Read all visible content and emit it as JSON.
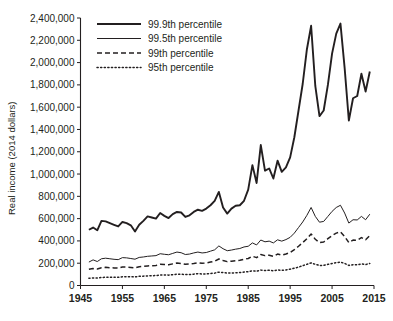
{
  "chart_data": {
    "type": "line",
    "title": "",
    "xlabel": "",
    "ylabel": "Real income (2014 dollars)",
    "xlim": [
      1945,
      2015
    ],
    "ylim": [
      0,
      2400000
    ],
    "xticks": [
      1945,
      1955,
      1965,
      1975,
      1985,
      1995,
      2005,
      2015
    ],
    "yticks": [
      0,
      200000,
      400000,
      600000,
      800000,
      1000000,
      1200000,
      1400000,
      1600000,
      1800000,
      2000000,
      2200000,
      2400000
    ],
    "ytick_labels": [
      "0",
      "200,000",
      "400,000",
      "600,000",
      "800,000",
      "1,000,000",
      "1,200,000",
      "1,400,000",
      "1,600,000",
      "1,800,000",
      "2,000,000",
      "2,200,000",
      "2,400,000"
    ],
    "xtick_labels": [
      "1945",
      "1955",
      "1965",
      "1975",
      "1985",
      "1995",
      "2005",
      "2015"
    ],
    "grid": false,
    "legend_position": "top-center",
    "x": [
      1947,
      1948,
      1949,
      1950,
      1951,
      1952,
      1953,
      1954,
      1955,
      1956,
      1957,
      1958,
      1959,
      1960,
      1961,
      1962,
      1963,
      1964,
      1965,
      1966,
      1967,
      1968,
      1969,
      1970,
      1971,
      1972,
      1973,
      1974,
      1975,
      1976,
      1977,
      1978,
      1979,
      1980,
      1981,
      1982,
      1983,
      1984,
      1985,
      1986,
      1987,
      1988,
      1989,
      1990,
      1991,
      1992,
      1993,
      1994,
      1995,
      1996,
      1997,
      1998,
      1999,
      2000,
      2001,
      2002,
      2003,
      2004,
      2005,
      2006,
      2007,
      2008,
      2009,
      2010,
      2011,
      2012,
      2013,
      2014
    ],
    "series": [
      {
        "name": "99.9th percentile",
        "style": "solid-thick",
        "values": [
          500000,
          520000,
          495000,
          580000,
          575000,
          560000,
          545000,
          530000,
          570000,
          560000,
          540000,
          485000,
          545000,
          580000,
          620000,
          610000,
          600000,
          650000,
          625000,
          605000,
          640000,
          660000,
          655000,
          615000,
          630000,
          660000,
          680000,
          670000,
          690000,
          720000,
          760000,
          840000,
          700000,
          645000,
          690000,
          715000,
          720000,
          760000,
          860000,
          1080000,
          920000,
          1260000,
          1030000,
          1050000,
          960000,
          1120000,
          1020000,
          1060000,
          1150000,
          1330000,
          1570000,
          1810000,
          2120000,
          2330000,
          1790000,
          1520000,
          1570000,
          1800000,
          2080000,
          2260000,
          2350000,
          1950000,
          1480000,
          1680000,
          1700000,
          1900000,
          1740000,
          1920000
        ]
      },
      {
        "name": "99.5th percentile",
        "style": "solid-thin",
        "values": [
          210000,
          230000,
          215000,
          240000,
          245000,
          240000,
          235000,
          232000,
          250000,
          248000,
          242000,
          236000,
          252000,
          256000,
          262000,
          265000,
          268000,
          285000,
          280000,
          276000,
          288000,
          300000,
          294000,
          278000,
          282000,
          292000,
          300000,
          292000,
          296000,
          308000,
          320000,
          355000,
          330000,
          312000,
          318000,
          326000,
          332000,
          346000,
          352000,
          382000,
          364000,
          408000,
          392000,
          398000,
          382000,
          410000,
          398000,
          412000,
          432000,
          470000,
          520000,
          570000,
          630000,
          700000,
          620000,
          568000,
          575000,
          620000,
          665000,
          700000,
          720000,
          650000,
          560000,
          590000,
          588000,
          620000,
          590000,
          640000
        ]
      },
      {
        "name": "99th percentile",
        "style": "dashed",
        "values": [
          145000,
          152000,
          148000,
          160000,
          163000,
          160000,
          158000,
          156000,
          166000,
          165000,
          162000,
          158000,
          168000,
          172000,
          176000,
          178000,
          180000,
          190000,
          188000,
          186000,
          194000,
          202000,
          198000,
          190000,
          193000,
          198000,
          204000,
          199000,
          202000,
          210000,
          218000,
          238000,
          225000,
          214000,
          218000,
          222000,
          226000,
          236000,
          242000,
          262000,
          250000,
          278000,
          268000,
          272000,
          262000,
          282000,
          272000,
          282000,
          296000,
          322000,
          352000,
          385000,
          420000,
          462000,
          415000,
          385000,
          390000,
          420000,
          448000,
          470000,
          482000,
          440000,
          385000,
          408000,
          406000,
          430000,
          410000,
          448000
        ]
      },
      {
        "name": "95th percentile",
        "style": "dotted",
        "values": [
          65000,
          68000,
          67000,
          72000,
          74000,
          74000,
          73000,
          73000,
          78000,
          79000,
          78000,
          77000,
          82000,
          84000,
          86000,
          88000,
          89000,
          94000,
          94000,
          93000,
          97000,
          102000,
          101000,
          98000,
          99000,
          102000,
          106000,
          103000,
          104000,
          108000,
          111000,
          120000,
          116000,
          111000,
          112000,
          114000,
          116000,
          121000,
          124000,
          132000,
          128000,
          138000,
          135000,
          136000,
          132000,
          140000,
          136000,
          140000,
          146000,
          155000,
          165000,
          178000,
          190000,
          203000,
          190000,
          180000,
          181000,
          190000,
          198000,
          205000,
          210000,
          198000,
          180000,
          187000,
          186000,
          194000,
          188000,
          198000
        ]
      }
    ],
    "legend": [
      {
        "label": "99.9th percentile",
        "style": "solid-thick"
      },
      {
        "label": "99.5th percentile",
        "style": "solid-thin"
      },
      {
        "label": "99th percentile",
        "style": "dashed"
      },
      {
        "label": "95th percentile",
        "style": "dotted"
      }
    ]
  }
}
